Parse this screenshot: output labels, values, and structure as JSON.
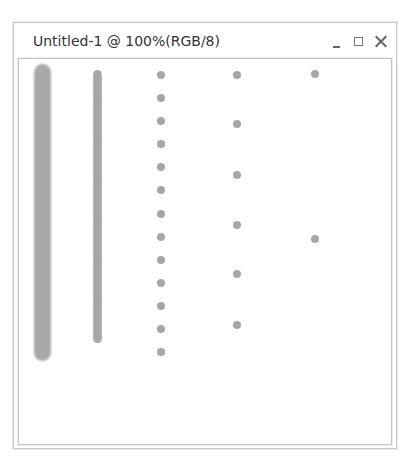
{
  "window": {
    "title": "Untitled-1 @ 100%(RGB/8)",
    "controls": [
      "minimize",
      "maximize",
      "close"
    ]
  },
  "canvas": {
    "background": "#ffffff",
    "stroke_color": "#a8a8a8",
    "strokes": [
      {
        "kind": "continuous",
        "x": 42,
        "y_top": 64,
        "y_bottom": 361,
        "width": 17
      },
      {
        "kind": "beaded",
        "x": 97,
        "y_top": 70,
        "y_bottom": 343,
        "width": 9
      }
    ],
    "dot_columns": [
      {
        "x": 161,
        "ys": [
          75,
          98,
          121,
          144,
          167,
          190,
          214,
          237,
          260,
          283,
          306,
          329,
          352
        ]
      },
      {
        "x": 237,
        "ys": [
          75,
          124,
          175,
          225,
          274,
          325
        ]
      },
      {
        "x": 315,
        "ys": [
          74,
          239
        ]
      }
    ]
  }
}
